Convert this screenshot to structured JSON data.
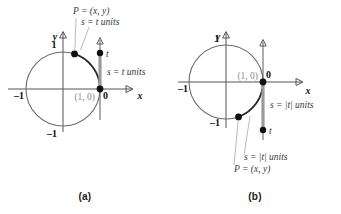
{
  "figure": {
    "panels": [
      {
        "id": "a",
        "caption": "(a)",
        "case": "positive t",
        "labels": {
          "point_p": "P = (x, y)",
          "arc_length": "s = t units",
          "segment_length": "s = t units",
          "origin_marker": "0",
          "t_marker": "t",
          "point_on_axis": "(1, 0)",
          "y_axis": "y",
          "x_axis": "x",
          "y_top_tick": "1",
          "y_bottom_tick": "–1",
          "x_left_tick": "–1"
        }
      },
      {
        "id": "b",
        "caption": "(b)",
        "case": "negative t",
        "labels": {
          "point_p": "P = (x, y)",
          "arc_length": "s = |t| units",
          "segment_length": "s = |t| units",
          "origin_marker": "0",
          "t_marker": "t",
          "point_on_axis": "(1, 0)",
          "y_axis": "y",
          "x_axis": "x",
          "y_top_tick": "1",
          "y_bottom_tick": "–1",
          "x_left_tick": "–1"
        }
      }
    ],
    "colors": {
      "circle": "#6b6b6b",
      "highlight_arc": "#2b2b2b",
      "segment": "#9a9a9a",
      "axis": "#555555",
      "label_gray": "#8c8c8c",
      "label_dark": "#111111",
      "background": "#ffffff"
    }
  }
}
